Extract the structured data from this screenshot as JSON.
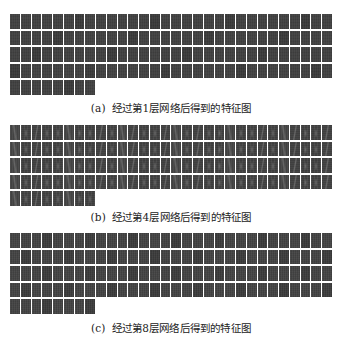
{
  "figure": {
    "panels": [
      {
        "id": "a",
        "tag": "(a)",
        "caption": "经过第1层网络后得到的特征图",
        "layer": 1,
        "feature_map_count": 128,
        "columns": 30,
        "style": "a"
      },
      {
        "id": "b",
        "tag": "(b)",
        "caption": "经过第4层网络后得到的特征图",
        "layer": 4,
        "feature_map_count": 128,
        "columns": 30,
        "style": "b"
      },
      {
        "id": "c",
        "tag": "(c)",
        "caption": "经过第8层网络后得到的特征图",
        "layer": 8,
        "feature_map_count": 128,
        "columns": 30,
        "style": "c"
      }
    ],
    "colors": {
      "cell_base": "#414141",
      "gap": "#ffffff",
      "caption_text": "#222222"
    }
  }
}
